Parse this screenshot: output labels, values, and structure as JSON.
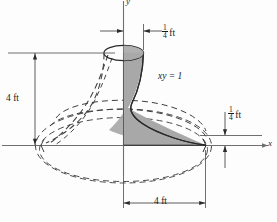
{
  "figure": {
    "axes": {
      "x_label": "x",
      "y_label": "y"
    },
    "curve_label": "xy = 1",
    "dimensions": {
      "top_width": {
        "numerator": "1",
        "denominator": "4",
        "unit": "ft"
      },
      "left_height": {
        "value": "4 ft"
      },
      "right_height": {
        "numerator": "1",
        "denominator": "4",
        "unit": "ft"
      },
      "bottom_width": {
        "value": "4 ft"
      }
    },
    "colors": {
      "shade_fill": "#a8a8a8",
      "line": "#2b2b2b",
      "dashed": "#3a3a3a",
      "background": "#fdfdfd"
    }
  }
}
